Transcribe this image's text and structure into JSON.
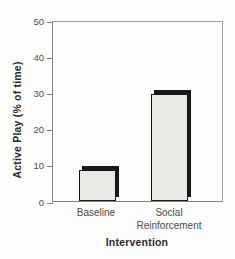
{
  "chart_data": {
    "type": "bar",
    "title": "",
    "categories": [
      "Baseline",
      "Social Reinforcement"
    ],
    "values": [
      8.5,
      29.5
    ],
    "xlabel": "Intervention",
    "ylabel": "Active Play (% of time)",
    "ylim": [
      0,
      50
    ],
    "yticks": [
      0,
      10,
      20,
      30,
      40,
      50
    ],
    "grid": false,
    "legend": false,
    "colors": {
      "background": "#fcfcfa",
      "bar_fill": "#e9e8e4",
      "bar_border": "#181818",
      "bar_shadow": "#181818",
      "axis_line": "#858585",
      "frame_line": "#a3a3a3",
      "tick_text": "#4d4d4d",
      "title_text": "#2d2d2d"
    }
  }
}
